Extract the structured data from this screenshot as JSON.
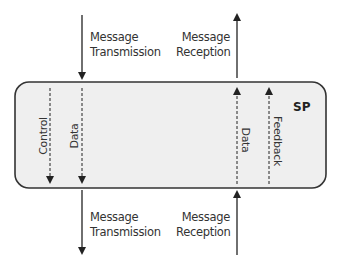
{
  "diagram": {
    "box": {
      "label": "SP",
      "fill": "#f0f0f0",
      "stroke": "#333333"
    },
    "top": {
      "transmission": {
        "line1": "Message",
        "line2": "Transmission",
        "direction": "down"
      },
      "reception": {
        "line1": "Message",
        "line2": "Reception",
        "direction": "up"
      }
    },
    "bottom": {
      "transmission": {
        "line1": "Message",
        "line2": "Transmission",
        "direction": "down"
      },
      "reception": {
        "line1": "Message",
        "line2": "Reception",
        "direction": "up"
      }
    },
    "internal_lines": [
      {
        "label": "Control",
        "direction": "down",
        "style": "dashed"
      },
      {
        "label": "Data",
        "direction": "down",
        "style": "dashed"
      },
      {
        "label": "Data",
        "direction": "up",
        "style": "dashed"
      },
      {
        "label": "Feedback",
        "direction": "up",
        "style": "dashed"
      }
    ]
  }
}
